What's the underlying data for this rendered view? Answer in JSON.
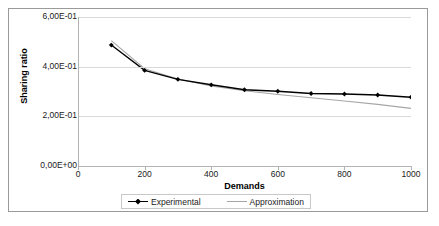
{
  "chart_data": {
    "type": "line",
    "title": "",
    "xlabel": "Demands",
    "ylabel": "Sharing ratio",
    "xlim": [
      0,
      1000
    ],
    "ylim": [
      0,
      0.6
    ],
    "x_ticks": [
      "0",
      "200",
      "400",
      "600",
      "800",
      "1000"
    ],
    "x_tick_values": [
      0,
      200,
      400,
      600,
      800,
      1000
    ],
    "y_ticks": [
      "0,00E+00",
      "2,00E-01",
      "4,00E-01",
      "6,00E-01"
    ],
    "y_tick_values": [
      0,
      0.2,
      0.4,
      0.6
    ],
    "grid": "horizontal",
    "legend_position": "bottom",
    "x": [
      100,
      200,
      300,
      400,
      500,
      600,
      700,
      800,
      900,
      1000
    ],
    "series": [
      {
        "name": "Experimental",
        "color": "#000000",
        "marker": "diamond",
        "values": [
          0.487,
          0.385,
          0.349,
          0.327,
          0.307,
          0.301,
          0.292,
          0.29,
          0.286,
          0.277
        ]
      },
      {
        "name": "Approximation",
        "color": "#a6a6a6",
        "marker": "none",
        "values": [
          0.505,
          0.392,
          0.35,
          0.322,
          0.303,
          0.288,
          0.275,
          0.262,
          0.248,
          0.232
        ]
      }
    ],
    "colors": {
      "experimental": "#000000",
      "approximation": "#a6a6a6",
      "gridline": "#d9d9d9",
      "axis": "#b3b3b3",
      "frame": "#9a9a9a",
      "background": "#ffffff"
    }
  },
  "legend": {
    "items": [
      {
        "label": "Experimental"
      },
      {
        "label": "Approximation"
      }
    ]
  }
}
